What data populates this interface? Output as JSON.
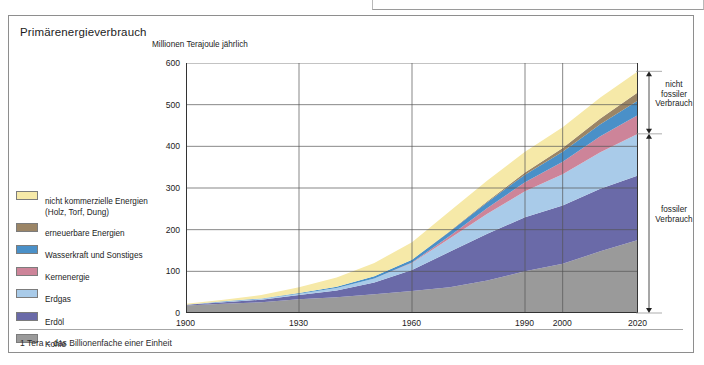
{
  "panel": {
    "title": "Primärenergieverbrauch",
    "footnote": "1 Tera = das Billionenfache einer Einheit"
  },
  "legend": {
    "items": [
      {
        "label": "nicht kommerzielle Energien",
        "sublabel": "(Holz, Torf, Dung)",
        "color": "#f6e9a8"
      },
      {
        "label": "erneuerbare Energien",
        "sublabel": "",
        "color": "#9b8566"
      },
      {
        "label": "Wasserkraft und Sonstiges",
        "sublabel": "",
        "color": "#4a90c8"
      },
      {
        "label": "Kernenergie",
        "sublabel": "",
        "color": "#cd8499"
      },
      {
        "label": "Erdgas",
        "sublabel": "",
        "color": "#a9cbe9"
      },
      {
        "label": "Erdöl",
        "sublabel": "",
        "color": "#6a6aa8"
      },
      {
        "label": "Kohle",
        "sublabel": "",
        "color": "#9a9a9a"
      }
    ]
  },
  "annotations": {
    "non_fossil": "nicht\nfossiler\nVerbrauch",
    "non_fossil_lines": [
      "nicht",
      "fossiler",
      "Verbrauch"
    ],
    "fossil_lines": [
      "fossiler",
      "Verbrauch"
    ]
  },
  "chart_data": {
    "type": "area",
    "title": "Primärenergieverbrauch",
    "subtitle": "",
    "xlabel": "",
    "ylabel": "Millionen Terajoule jährlich",
    "x": [
      1900,
      1910,
      1920,
      1930,
      1940,
      1950,
      1960,
      1970,
      1980,
      1990,
      2000,
      2010,
      2020
    ],
    "xtick_labels": [
      "1900",
      "1930",
      "1960",
      "1990",
      "2000",
      "2020"
    ],
    "xticks": [
      1900,
      1930,
      1960,
      1990,
      2000,
      2020
    ],
    "xlim": [
      1900,
      2020
    ],
    "ylim": [
      0,
      600
    ],
    "yticks": [
      0,
      100,
      200,
      300,
      400,
      500,
      600
    ],
    "ytick_labels": [
      "0",
      "100",
      "200",
      "300",
      "400",
      "500",
      "600"
    ],
    "grid": true,
    "stacked": true,
    "legend_position": "left",
    "series": [
      {
        "name": "Kohle",
        "color": "#9a9a9a",
        "values": [
          18,
          22,
          26,
          33,
          38,
          45,
          53,
          62,
          78,
          100,
          118,
          148,
          175
        ]
      },
      {
        "name": "Erdöl",
        "color": "#6a6aa8",
        "values": [
          2,
          4,
          6,
          10,
          16,
          28,
          50,
          85,
          112,
          130,
          140,
          150,
          155
        ]
      },
      {
        "name": "Erdgas",
        "color": "#a9cbe9",
        "values": [
          0,
          1,
          2,
          3,
          6,
          10,
          17,
          32,
          48,
          62,
          75,
          88,
          100
        ]
      },
      {
        "name": "Kernenergie",
        "color": "#cd8499",
        "values": [
          0,
          0,
          0,
          0,
          0,
          0,
          1,
          6,
          14,
          22,
          30,
          38,
          45
        ]
      },
      {
        "name": "Wasserkraft und Sonstiges",
        "color": "#4a90c8",
        "values": [
          0,
          1,
          1,
          2,
          3,
          5,
          7,
          10,
          14,
          18,
          24,
          29,
          35
        ]
      },
      {
        "name": "erneuerbare Energien",
        "color": "#9b8566",
        "values": [
          0,
          0,
          0,
          0,
          0,
          0,
          0,
          1,
          2,
          5,
          9,
          14,
          20
        ]
      },
      {
        "name": "nicht kommerzielle Energien",
        "color": "#f6e9a8",
        "values": [
          2,
          4,
          8,
          14,
          22,
          32,
          42,
          48,
          50,
          50,
          50,
          50,
          50
        ]
      }
    ],
    "totals": [
      22,
      32,
      43,
      62,
      85,
      120,
      170,
      244,
      318,
      387,
      446,
      517,
      580
    ],
    "brackets": [
      {
        "label": "nicht fossiler Verbrauch",
        "from": 430,
        "to": 580
      },
      {
        "label": "fossiler Verbrauch",
        "from": 0,
        "to": 430
      }
    ]
  }
}
